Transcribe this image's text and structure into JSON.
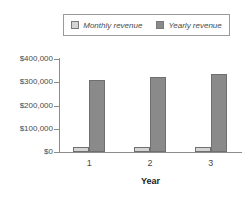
{
  "chart_data": {
    "type": "bar",
    "title": "",
    "subtitle": "",
    "categories": [
      "1",
      "2",
      "3"
    ],
    "series": [
      {
        "name": "Monthly revenue",
        "color": "#d4d4d4",
        "values": [
          20000,
          20000,
          20000
        ]
      },
      {
        "name": "Yearly revenue",
        "color": "#8a8a8a",
        "values": [
          310000,
          322000,
          335000
        ]
      }
    ],
    "xlabel": "Year",
    "ylabel": "",
    "ylim": [
      0,
      400000
    ],
    "yticks": [
      0,
      100000,
      200000,
      300000,
      400000
    ],
    "ytick_labels": [
      "$0",
      "$100,000",
      "$200,000",
      "$300,000",
      "$400,000"
    ],
    "xtick_labels": [
      "1",
      "2",
      "3"
    ],
    "grid": false,
    "legend_position": "top"
  },
  "legend": {
    "entries": [
      {
        "label": "Monthly revenue",
        "swatch": "#d4d4d4"
      },
      {
        "label": "Yearly revenue",
        "swatch": "#8a8a8a"
      }
    ]
  },
  "axes": {
    "x_title": "Year",
    "y_labels": [
      "$400,000",
      "$300,000",
      "$200,000",
      "$100,000",
      "$0"
    ],
    "x_labels": [
      "1",
      "2",
      "3"
    ]
  },
  "colors": {
    "monthly": "#d4d4d4",
    "yearly": "#8a8a8a",
    "axis": "#8c8c8c",
    "text": "#4a4a4a",
    "background": "#ffffff"
  }
}
